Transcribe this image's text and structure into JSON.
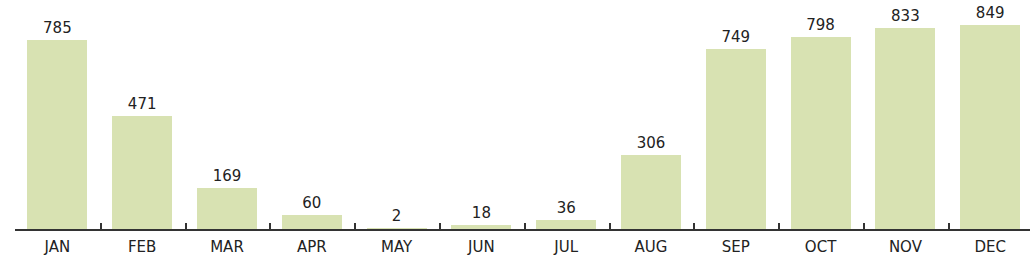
{
  "chart_data": {
    "type": "bar",
    "title": "",
    "xlabel": "",
    "ylabel": "",
    "categories": [
      "JAN",
      "FEB",
      "MAR",
      "APR",
      "MAY",
      "JUN",
      "JUL",
      "AUG",
      "SEP",
      "OCT",
      "NOV",
      "DEC"
    ],
    "values": [
      785,
      471,
      169,
      60,
      2,
      18,
      36,
      306,
      749,
      798,
      833,
      849
    ],
    "ylim": [
      0,
      870
    ],
    "grid": false,
    "legend": null,
    "data_labels": true,
    "bar_color": "#d8e2b2",
    "axis_color": "#333333"
  }
}
